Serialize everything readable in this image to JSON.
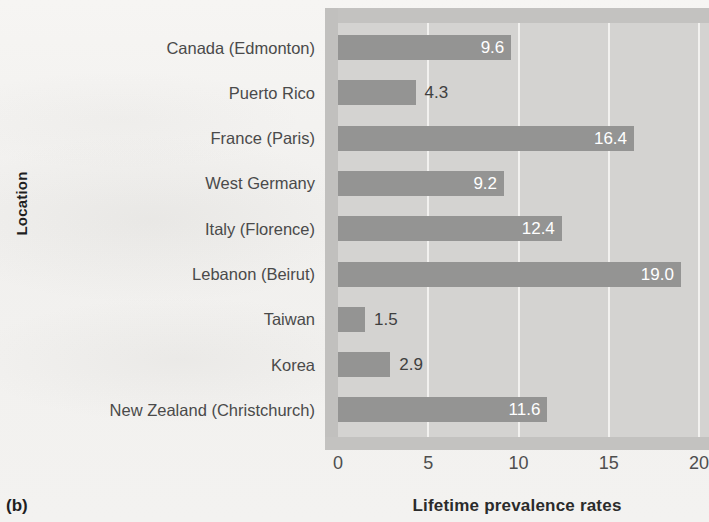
{
  "figure": {
    "panel_label": "(b)",
    "y_axis_title": "Location",
    "x_axis_title": "Lifetime prevalence rates"
  },
  "chart_data": {
    "type": "bar",
    "orientation": "horizontal",
    "title": "",
    "xlabel": "Lifetime prevalence rates",
    "ylabel": "Location",
    "xlim": [
      0,
      20
    ],
    "xticks": [
      0,
      5,
      10,
      15,
      20
    ],
    "xtick_labels": [
      "0",
      "5",
      "10",
      "15",
      "20"
    ],
    "grid": "vertical-only",
    "legend": "none",
    "categories": [
      "Canada (Edmonton)",
      "Puerto Rico",
      "France (Paris)",
      "West Germany",
      "Italy (Florence)",
      "Lebanon (Beirut)",
      "Taiwan",
      "Korea",
      "New Zealand (Christchurch)"
    ],
    "values": [
      9.6,
      4.3,
      16.4,
      9.2,
      12.4,
      19.0,
      1.5,
      2.9,
      11.6
    ],
    "value_labels": [
      "9.6",
      "4.3",
      "16.4",
      "9.2",
      "12.4",
      "19.0",
      "1.5",
      "2.9",
      "11.6"
    ],
    "label_placement": [
      "inside",
      "outside",
      "inside",
      "inside",
      "inside",
      "inside",
      "outside",
      "outside",
      "inside"
    ]
  },
  "colors": {
    "bar": "#949493",
    "plot_background": "#d4d3d1",
    "plot_band": "#c3c2c0",
    "gridline": "#f2f1ef",
    "label_inside": "#ffffff",
    "label_outside": "#3f3f3f",
    "page_background": "#f3f2f0"
  }
}
